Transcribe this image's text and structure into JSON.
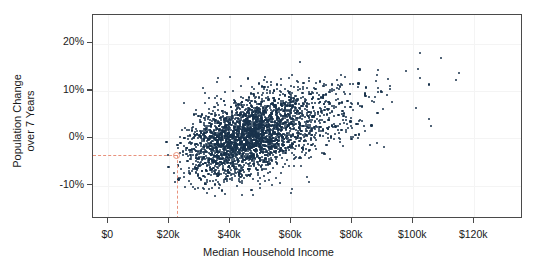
{
  "chart_data": {
    "type": "scatter",
    "title": "",
    "xlabel": "Median Household Income",
    "ylabel_line1": "Population Change",
    "ylabel_line2": "over 7 Years",
    "xlim": [
      -5000,
      136000
    ],
    "ylim": [
      -17,
      26
    ],
    "xticks": [
      0,
      20000,
      40000,
      60000,
      80000,
      100000,
      120000
    ],
    "xtick_labels": [
      "$0",
      "$20k",
      "$40k",
      "$60k",
      "$80k",
      "$100k",
      "$120k"
    ],
    "yticks": [
      -10,
      0,
      10,
      20
    ],
    "ytick_labels": [
      "-10%",
      "0%",
      "10%",
      "20%"
    ],
    "grid": true,
    "legend": "none",
    "point_color": "#18324b",
    "point_count": 3000,
    "highlight": {
      "x": 22500,
      "y": -3.5,
      "marker": "open-circle",
      "color": "#e8927c",
      "guide_lines": [
        "horizontal",
        "vertical"
      ],
      "line_style": "dashed"
    },
    "distribution": {
      "x_mean": 47000,
      "x_sd": 12000,
      "x_min": 18500,
      "x_max": 131000,
      "y_intercept": -7.5,
      "slope_per_10k": 1.75,
      "y_noise_sd": 4.0,
      "correlation": 0.42
    },
    "series": [
      {
        "name": "counties",
        "points_summary": [
          {
            "x": 22500,
            "y": -3.5,
            "note": "highlighted reference point"
          },
          {
            "x": 45000,
            "y": 0.5,
            "note": "cloud centroid"
          },
          {
            "x": 62000,
            "y": 22.0,
            "note": "high outlier"
          },
          {
            "x": 131000,
            "y": 13.5,
            "note": "far right outlier"
          },
          {
            "x": 46000,
            "y": -15.5,
            "note": "low outlier"
          }
        ]
      }
    ]
  },
  "axes": {
    "panel_border_color": "#4a4a4a",
    "gridline_color": "#f4f4f4",
    "background": "#ffffff"
  }
}
